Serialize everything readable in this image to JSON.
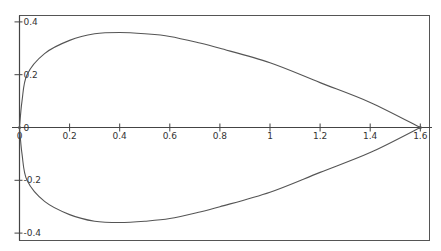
{
  "chart_data": {
    "type": "line",
    "title": "",
    "xlabel": "",
    "ylabel": "",
    "xlim": [
      0,
      1.62
    ],
    "ylim": [
      -0.4,
      0.4
    ],
    "grid": false,
    "legend": null,
    "x_ticks": [
      0,
      0.2,
      0.4,
      0.6,
      0.8,
      1,
      1.2,
      1.4,
      1.6
    ],
    "x_tick_labels": [
      "0",
      "0.2",
      "0.4",
      "0.6",
      "0.8",
      "1",
      "1.2",
      "1.4",
      "1.6"
    ],
    "y_ticks": [
      0.4,
      0.2,
      0,
      -0.2,
      -0.4
    ],
    "y_tick_labels": [
      "0.4",
      "0.2",
      "0",
      "-0.2",
      "-0.4"
    ],
    "series": [
      {
        "name": "upper branch",
        "x": [
          0,
          0.01,
          0.03,
          0.1,
          0.2,
          0.3,
          0.4,
          0.5,
          0.6,
          0.72,
          0.8,
          1.0,
          1.2,
          1.4,
          1.6
        ],
        "y": [
          0,
          0.1,
          0.2,
          0.28,
          0.33,
          0.355,
          0.36,
          0.355,
          0.345,
          0.32,
          0.3,
          0.245,
          0.17,
          0.095,
          0
        ]
      },
      {
        "name": "lower branch",
        "x": [
          0,
          0.01,
          0.03,
          0.1,
          0.2,
          0.3,
          0.4,
          0.5,
          0.6,
          0.72,
          0.8,
          1.0,
          1.2,
          1.4,
          1.6
        ],
        "y": [
          0,
          -0.1,
          -0.2,
          -0.28,
          -0.33,
          -0.355,
          -0.36,
          -0.355,
          -0.345,
          -0.32,
          -0.3,
          -0.245,
          -0.17,
          -0.095,
          0
        ]
      }
    ],
    "colors": {
      "curve": "#555555",
      "axis": "#444444",
      "frame": "#555555"
    }
  }
}
